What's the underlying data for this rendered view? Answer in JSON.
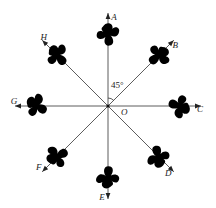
{
  "diagram": {
    "center_label": "O",
    "angle_label": "45°",
    "rays": [
      {
        "label": "A",
        "direction_deg": 90
      },
      {
        "label": "B",
        "direction_deg": 45
      },
      {
        "label": "C",
        "direction_deg": 0
      },
      {
        "label": "D",
        "direction_deg": -45
      },
      {
        "label": "E",
        "direction_deg": -90
      },
      {
        "label": "F",
        "direction_deg": -135
      },
      {
        "label": "G",
        "direction_deg": 180
      },
      {
        "label": "H",
        "direction_deg": 135
      }
    ],
    "colors": {
      "line": "#333333",
      "blob": "#000000",
      "background": "#ffffff"
    }
  }
}
